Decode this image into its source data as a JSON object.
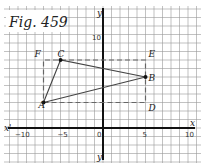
{
  "figure": {
    "title": "Fig. 459",
    "x_axis": {
      "pos_label": "x",
      "neg_label": "x'",
      "ticks": [
        {
          "value": -10,
          "label": "−10"
        },
        {
          "value": -5,
          "label": "−5"
        },
        {
          "value": 0,
          "label": "0"
        },
        {
          "value": 5,
          "label": "5"
        },
        {
          "value": 10,
          "label": "10"
        }
      ]
    },
    "y_axis": {
      "pos_label": "y",
      "neg_label": "y'",
      "ticks": [
        {
          "value": 10,
          "label": "10"
        }
      ]
    },
    "points": [
      {
        "name": "A",
        "x": -7,
        "y": 3
      },
      {
        "name": "B",
        "x": 5,
        "y": 6
      },
      {
        "name": "C",
        "x": -5,
        "y": 8
      },
      {
        "name": "D",
        "x": 5,
        "y": 3
      },
      {
        "name": "E",
        "x": 5,
        "y": 8
      },
      {
        "name": "F",
        "x": -7,
        "y": 8
      }
    ],
    "triangle": [
      "A",
      "B",
      "C"
    ],
    "dashed_rectangle": [
      "A",
      "D",
      "E",
      "F"
    ]
  }
}
